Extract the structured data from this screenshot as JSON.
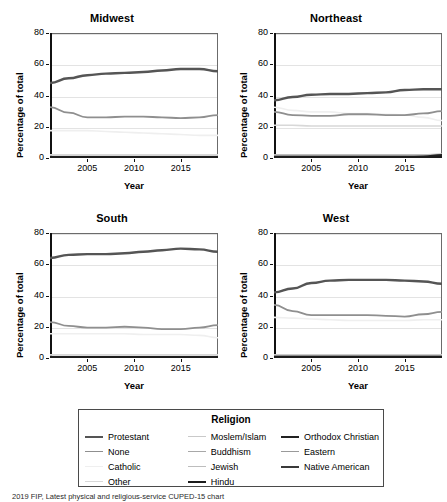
{
  "figure": {
    "caption": "2019 FIP, Latest physical and religious-service CUPED-15 chart"
  },
  "axes": {
    "ylabel": "Percentage of total",
    "xlabel": "Year",
    "yticks": [
      "0",
      "20",
      "40",
      "60",
      "80"
    ],
    "xticks": [
      "2005",
      "2010",
      "2015"
    ]
  },
  "legend": {
    "title": "Religion",
    "columns": [
      [
        {
          "label": "Protestant",
          "color": "#555555",
          "width": 2.4
        },
        {
          "label": "None",
          "color": "#8f8f8f",
          "width": 1.8
        },
        {
          "label": "Catholic",
          "color": "#efefef",
          "width": 1.6
        },
        {
          "label": "Other",
          "color": "#d8d8d8",
          "width": 1.6
        }
      ],
      [
        {
          "label": "Moslem/Islam",
          "color": "#c9c9c9",
          "width": 1.6
        },
        {
          "label": "Buddhism",
          "color": "#a8a8a8",
          "width": 1.6
        },
        {
          "label": "Jewish",
          "color": "#bdbdbd",
          "width": 1.6
        },
        {
          "label": "Hindu",
          "color": "#1c1c1c",
          "width": 2.4
        }
      ],
      [
        {
          "label": "Orthodox Christian",
          "color": "#222222",
          "width": 2.4
        },
        {
          "label": "Eastern",
          "color": "#9a9a9a",
          "width": 1.6
        },
        {
          "label": "Native American",
          "color": "#3a3a3a",
          "width": 2.4
        }
      ]
    ]
  },
  "chart_data": {
    "type": "line",
    "title": "",
    "xlabel": "Year",
    "ylabel": "Percentage of total",
    "xlim": [
      2001,
      2019
    ],
    "ylim": [
      0,
      80
    ],
    "grid": true,
    "legend_position": "bottom",
    "x": [
      2001,
      2003,
      2005,
      2007,
      2009,
      2011,
      2013,
      2015,
      2017,
      2019
    ],
    "panels": [
      {
        "title": "Midwest",
        "series": [
          {
            "name": "Protestant",
            "color": "#555555",
            "width": 2.4,
            "values": [
              48,
              51,
              53,
              54,
              54.5,
              55,
              56,
              57,
              57,
              55.5
            ]
          },
          {
            "name": "None",
            "color": "#8f8f8f",
            "width": 1.8,
            "values": [
              32.5,
              29,
              26,
              26,
              26.5,
              26.5,
              26,
              25.5,
              26,
              27.5
            ]
          },
          {
            "name": "Catholic",
            "color": "#efefef",
            "width": 1.6,
            "values": [
              17.5,
              17.5,
              17.5,
              17,
              16.5,
              16,
              15.5,
              15,
              14.5,
              14.5
            ]
          },
          {
            "name": "Other",
            "color": "#d8d8d8",
            "width": 1.6,
            "values": [
              2,
              2,
              2,
              2,
              2,
              2,
              2,
              2,
              2,
              2
            ]
          },
          {
            "name": "Moslem/Islam",
            "color": "#c9c9c9",
            "width": 1.6,
            "values": [
              1,
              1,
              1,
              1,
              1,
              1,
              1,
              1,
              1,
              1
            ]
          },
          {
            "name": "Buddhism",
            "color": "#a8a8a8",
            "width": 1.6,
            "values": [
              0.7,
              0.7,
              0.7,
              0.7,
              0.7,
              0.7,
              0.7,
              0.7,
              0.7,
              0.7
            ]
          },
          {
            "name": "Jewish",
            "color": "#bdbdbd",
            "width": 1.6,
            "values": [
              0.9,
              0.9,
              0.9,
              0.9,
              0.9,
              0.9,
              0.9,
              0.9,
              0.9,
              0.9
            ]
          },
          {
            "name": "Hindu",
            "color": "#1c1c1c",
            "width": 2.4,
            "values": [
              0.4,
              0.4,
              0.4,
              0.4,
              0.4,
              0.4,
              0.4,
              0.4,
              0.4,
              0.4
            ]
          },
          {
            "name": "Orthodox Christian",
            "color": "#222222",
            "width": 2.4,
            "values": [
              0.3,
              0.3,
              0.3,
              0.3,
              0.3,
              0.3,
              0.3,
              0.3,
              0.3,
              0.3
            ]
          },
          {
            "name": "Eastern",
            "color": "#9a9a9a",
            "width": 1.6,
            "values": [
              0.2,
              0.2,
              0.2,
              0.2,
              0.2,
              0.2,
              0.2,
              0.2,
              0.2,
              0.2
            ]
          },
          {
            "name": "Native American",
            "color": "#3a3a3a",
            "width": 2.4,
            "values": [
              0.5,
              0.5,
              0.5,
              0.5,
              0.5,
              0.5,
              0.5,
              0.5,
              0.5,
              0.5
            ]
          }
        ]
      },
      {
        "title": "Northeast",
        "series": [
          {
            "name": "Protestant",
            "color": "#555555",
            "width": 2.4,
            "values": [
              37,
              39,
              40.5,
              41,
              41,
              41.5,
              42,
              43.5,
              44,
              44
            ]
          },
          {
            "name": "None",
            "color": "#8f8f8f",
            "width": 1.8,
            "values": [
              29.5,
              27.5,
              27,
              27,
              28,
              28,
              27.5,
              27.5,
              28.5,
              30
            ]
          },
          {
            "name": "Catholic",
            "color": "#efefef",
            "width": 1.6,
            "values": [
              32.5,
              30.5,
              29.5,
              29.5,
              28.5,
              28.5,
              28,
              27.5,
              26,
              24
            ]
          },
          {
            "name": "Other",
            "color": "#d8d8d8",
            "width": 1.6,
            "values": [
              21,
              21,
              20.5,
              20.5,
              20.5,
              20.5,
              20.5,
              20.5,
              20.5,
              20.5
            ]
          },
          {
            "name": "Moslem/Islam",
            "color": "#c9c9c9",
            "width": 1.6,
            "values": [
              1.5,
              1.5,
              1.5,
              1.5,
              1.5,
              1.5,
              1.5,
              1.5,
              1.5,
              1.5
            ]
          },
          {
            "name": "Buddhism",
            "color": "#a8a8a8",
            "width": 1.6,
            "values": [
              1,
              1,
              1,
              1,
              1,
              1,
              1,
              1,
              1,
              1
            ]
          },
          {
            "name": "Jewish",
            "color": "#bdbdbd",
            "width": 1.6,
            "values": [
              2,
              2,
              2,
              2,
              2,
              2,
              2,
              2,
              2,
              2.5
            ]
          },
          {
            "name": "Hindu",
            "color": "#1c1c1c",
            "width": 2.4,
            "values": [
              0.5,
              0.5,
              0.5,
              0.5,
              0.5,
              0.5,
              0.5,
              0.5,
              0.5,
              0.5
            ]
          },
          {
            "name": "Orthodox Christian",
            "color": "#222222",
            "width": 2.4,
            "values": [
              0.6,
              0.6,
              0.6,
              0.6,
              0.6,
              0.6,
              0.6,
              0.7,
              0.8,
              1.8
            ]
          },
          {
            "name": "Eastern",
            "color": "#9a9a9a",
            "width": 1.6,
            "values": [
              0.3,
              0.3,
              0.3,
              0.3,
              0.3,
              0.3,
              0.3,
              0.3,
              0.3,
              0.3
            ]
          },
          {
            "name": "Native American",
            "color": "#3a3a3a",
            "width": 2.4,
            "values": [
              0.4,
              0.4,
              0.4,
              0.4,
              0.4,
              0.4,
              0.4,
              0.4,
              0.4,
              0.4
            ]
          }
        ]
      },
      {
        "title": "South",
        "series": [
          {
            "name": "Protestant",
            "color": "#555555",
            "width": 2.4,
            "values": [
              64,
              66,
              66.5,
              66.5,
              67,
              68,
              69,
              70,
              69.5,
              68
            ]
          },
          {
            "name": "None",
            "color": "#8f8f8f",
            "width": 1.8,
            "values": [
              23,
              20.5,
              19.5,
              19.5,
              20,
              19.5,
              18.5,
              18.5,
              19.5,
              21
            ]
          },
          {
            "name": "Catholic",
            "color": "#efefef",
            "width": 1.6,
            "values": [
              15.5,
              15.5,
              15.5,
              15.5,
              15.5,
              15,
              15,
              15,
              14.5,
              13
            ]
          },
          {
            "name": "Other",
            "color": "#d8d8d8",
            "width": 1.6,
            "values": [
              2,
              2,
              2,
              2,
              2,
              2,
              2,
              2,
              2,
              2
            ]
          },
          {
            "name": "Moslem/Islam",
            "color": "#c9c9c9",
            "width": 1.6,
            "values": [
              1,
              1,
              1,
              1,
              1,
              1,
              1,
              1,
              1,
              1
            ]
          },
          {
            "name": "Buddhism",
            "color": "#a8a8a8",
            "width": 1.6,
            "values": [
              0.6,
              0.6,
              0.6,
              0.6,
              0.6,
              0.6,
              0.6,
              0.6,
              0.6,
              0.6
            ]
          },
          {
            "name": "Jewish",
            "color": "#bdbdbd",
            "width": 1.6,
            "values": [
              0.8,
              0.8,
              0.8,
              0.8,
              0.8,
              0.8,
              0.8,
              0.8,
              0.8,
              0.8
            ]
          },
          {
            "name": "Hindu",
            "color": "#1c1c1c",
            "width": 2.4,
            "values": [
              0.4,
              0.4,
              0.4,
              0.4,
              0.4,
              0.4,
              0.4,
              0.4,
              0.4,
              0.4
            ]
          },
          {
            "name": "Orthodox Christian",
            "color": "#222222",
            "width": 2.4,
            "values": [
              0.3,
              0.3,
              0.3,
              0.3,
              0.3,
              0.3,
              0.3,
              0.3,
              0.3,
              0.3
            ]
          },
          {
            "name": "Eastern",
            "color": "#9a9a9a",
            "width": 1.6,
            "values": [
              0.2,
              0.2,
              0.2,
              0.2,
              0.2,
              0.2,
              0.2,
              0.2,
              0.2,
              0.2
            ]
          },
          {
            "name": "Native American",
            "color": "#3a3a3a",
            "width": 2.4,
            "values": [
              0.5,
              0.5,
              0.5,
              0.5,
              0.5,
              0.5,
              0.5,
              0.5,
              0.5,
              0.5
            ]
          }
        ]
      },
      {
        "title": "West",
        "series": [
          {
            "name": "Protestant",
            "color": "#555555",
            "width": 2.4,
            "values": [
              42,
              44.5,
              48,
              49.5,
              50,
              50,
              50,
              49.5,
              49,
              47.5
            ]
          },
          {
            "name": "None",
            "color": "#8f8f8f",
            "width": 1.8,
            "values": [
              34,
              30,
              27.5,
              27.5,
              27.5,
              27.5,
              27,
              26.5,
              28,
              29.5
            ]
          },
          {
            "name": "Catholic",
            "color": "#efefef",
            "width": 1.6,
            "values": [
              26,
              25.5,
              25,
              24.5,
              24,
              24,
              24,
              24,
              24.5,
              24.5
            ]
          },
          {
            "name": "Other",
            "color": "#d8d8d8",
            "width": 1.6,
            "values": [
              2,
              2,
              2,
              2,
              2,
              2,
              2,
              2,
              2,
              2
            ]
          },
          {
            "name": "Moslem/Islam",
            "color": "#c9c9c9",
            "width": 1.6,
            "values": [
              1,
              1,
              1,
              1,
              1,
              1,
              1,
              1,
              1,
              1
            ]
          },
          {
            "name": "Buddhism",
            "color": "#a8a8a8",
            "width": 1.6,
            "values": [
              1.5,
              1.5,
              1.5,
              1.5,
              1.5,
              1.5,
              1.5,
              1.5,
              1.5,
              1.5
            ]
          },
          {
            "name": "Jewish",
            "color": "#bdbdbd",
            "width": 1.6,
            "values": [
              1,
              1,
              1,
              1,
              1,
              1,
              1,
              1,
              1,
              1
            ]
          },
          {
            "name": "Hindu",
            "color": "#1c1c1c",
            "width": 2.4,
            "values": [
              0.5,
              0.5,
              0.5,
              0.5,
              0.5,
              0.5,
              0.5,
              0.5,
              0.5,
              0.5
            ]
          },
          {
            "name": "Orthodox Christian",
            "color": "#222222",
            "width": 2.4,
            "values": [
              0.4,
              0.4,
              0.4,
              0.4,
              0.4,
              0.4,
              0.4,
              0.4,
              0.4,
              0.4
            ]
          },
          {
            "name": "Eastern",
            "color": "#9a9a9a",
            "width": 1.6,
            "values": [
              0.4,
              0.4,
              0.4,
              0.4,
              0.4,
              0.4,
              0.4,
              0.4,
              0.4,
              0.4
            ]
          },
          {
            "name": "Native American",
            "color": "#3a3a3a",
            "width": 2.4,
            "values": [
              0.6,
              0.6,
              0.6,
              0.6,
              0.6,
              0.6,
              0.6,
              0.6,
              0.6,
              0.6
            ]
          }
        ]
      }
    ]
  }
}
